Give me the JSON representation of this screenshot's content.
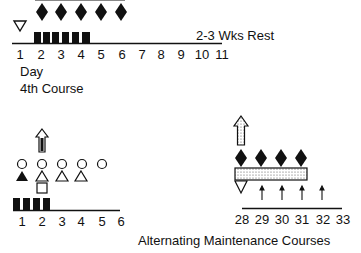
{
  "top_section": {
    "rest_label": "2-3 Wks Rest",
    "day_label": "Day",
    "course_label": "4th Course",
    "day_ticks": [
      "1",
      "2",
      "3",
      "4",
      "5",
      "6",
      "7",
      "8",
      "9",
      "10",
      "11"
    ]
  },
  "bottom_left": {
    "day_ticks": [
      "1",
      "2",
      "3",
      "4",
      "5",
      "6"
    ]
  },
  "bottom_right": {
    "day_ticks": [
      "28",
      "29",
      "30",
      "31",
      "32",
      "33"
    ]
  },
  "caption": "Alternating Maintenance Courses",
  "colors": {
    "ink": "#111111",
    "background": "#ffffff",
    "stipple": "#d8d8d8"
  }
}
